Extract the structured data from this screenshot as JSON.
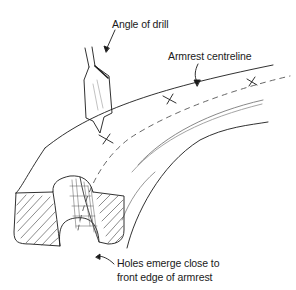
{
  "diagram": {
    "type": "technical-illustration",
    "labels": {
      "drill_angle": "Angle of drill",
      "centreline": "Armrest centreline",
      "holes_line1": "Holes emerge close to",
      "holes_line2": "front edge of armrest"
    },
    "colors": {
      "ink": "#1a1a1a",
      "light_ink": "#8a8a8a",
      "background": "#ffffff"
    }
  }
}
